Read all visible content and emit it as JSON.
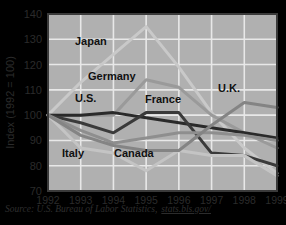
{
  "chart_data": {
    "type": "line",
    "title": "",
    "xlabel": "",
    "ylabel": "Index (1992 = 100)",
    "ylim": [
      70,
      140
    ],
    "yticks": [
      70,
      80,
      90,
      100,
      110,
      120,
      130,
      140
    ],
    "categories": [
      "1992",
      "1993",
      "1994",
      "1995",
      "1996",
      "1997",
      "1998",
      "1999"
    ],
    "x": [
      1992,
      1993,
      1994,
      1995,
      1996,
      1997,
      1998,
      1999
    ],
    "grid": true,
    "legend_position": "inline-annotations",
    "series": [
      {
        "name": "Japan",
        "color": "#c9c9c9",
        "width": 3.0,
        "values": [
          100,
          113,
          124,
          135,
          119,
          101,
          87,
          77
        ]
      },
      {
        "name": "Germany",
        "color": "#9a9a9a",
        "width": 3.0,
        "values": [
          100,
          100,
          100,
          114,
          111,
          100,
          93,
          87
        ]
      },
      {
        "name": "U.S.",
        "color": "#2a2a2a",
        "width": 3.0,
        "values": [
          100,
          100,
          101,
          99,
          97,
          95,
          93,
          91
        ]
      },
      {
        "name": "France",
        "color": "#3a3a3a",
        "width": 3.0,
        "values": [
          100,
          97,
          93,
          101,
          101,
          85,
          84,
          80
        ]
      },
      {
        "name": "Italy",
        "color": "#c4c4c4",
        "width": 3.0,
        "values": [
          100,
          87,
          85,
          78,
          86,
          84,
          84,
          76
        ]
      },
      {
        "name": "Canada",
        "color": "#8e8e8e",
        "width": 3.0,
        "values": [
          100,
          94,
          89,
          91,
          93,
          93,
          92,
          90
        ]
      },
      {
        "name": "U.K.",
        "color": "#848484",
        "width": 3.0,
        "values": [
          100,
          92,
          88,
          86,
          86,
          96,
          105,
          103
        ]
      }
    ],
    "annotations": [
      {
        "text": "Japan",
        "x": 75,
        "y": 45
      },
      {
        "text": "Germany",
        "x": 88,
        "y": 80
      },
      {
        "text": "U.S.",
        "x": 75,
        "y": 102
      },
      {
        "text": "France",
        "x": 145,
        "y": 103
      },
      {
        "text": "U.K.",
        "x": 218,
        "y": 92
      },
      {
        "text": "Italy",
        "x": 62,
        "y": 157
      },
      {
        "text": "Canada",
        "x": 114,
        "y": 157
      }
    ],
    "source_prefix": "Source: U.S. Bureau of Labor Statistics,",
    "source_link": "stats.bls.gov/"
  },
  "colors": {
    "background": "#a9a9a9",
    "plot_background": "#b0b0b0",
    "gridline": "#e8e8e8",
    "axis_border": "#3a3a3a",
    "text": "#2b2b2b"
  }
}
